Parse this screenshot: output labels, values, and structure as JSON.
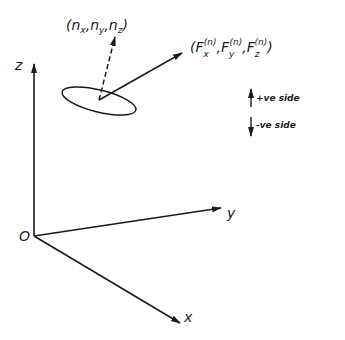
{
  "diagram": {
    "axes": {
      "origin_label": "O",
      "x_label": "x",
      "y_label": "y",
      "z_label": "z"
    },
    "normal_vector": {
      "label_open": "(",
      "nx": "n",
      "nx_sub": "x",
      "ny": "n",
      "ny_sub": "y",
      "nz": "n",
      "nz_sub": "z",
      "label_close": ")",
      "style": "dashed"
    },
    "force_vector": {
      "open": "(",
      "fx": "F",
      "fx_sub": "x",
      "fy": "F",
      "fy_sub": "y",
      "fz": "F",
      "fz_sub": "z",
      "sup": "(n)",
      "comma": ",",
      "close": ")"
    },
    "legend": {
      "items": [
        {
          "label": "+ve side",
          "direction": "up"
        },
        {
          "label": "-ve side",
          "direction": "down"
        }
      ]
    },
    "colors": {
      "ink": "#1a1a1a",
      "background": "#ffffff"
    }
  }
}
